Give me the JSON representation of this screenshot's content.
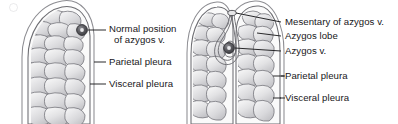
{
  "figure": {
    "background_color": "#ffffff",
    "ink_color": "#3a3a3e",
    "tissue_fill_light": "#f2f2f3",
    "tissue_fill_mid": "#d9d9dc",
    "tissue_fill_dark": "#b9b9bd",
    "vein_color": "#4a4a4e",
    "text_color": "#17171a"
  },
  "panels": [
    {
      "id": "normal-lung",
      "name": "Normal lung apex with normal azygos vein position",
      "labels": [
        {
          "id": "normal-position-azygos",
          "text": "Normal position of azygos v.",
          "line1": "Normal position",
          "line2": "of azygos v."
        },
        {
          "id": "parietal-pleura-left",
          "text": "Parietal pleura"
        },
        {
          "id": "visceral-pleura-left",
          "text": "Visceral pleura"
        }
      ],
      "structures": [
        "lung-apex-outline",
        "parietal-pleura-line",
        "visceral-pleura-line",
        "azygos-vein-marker",
        "lung-lobule-texture"
      ]
    },
    {
      "id": "azygos-lobe-lung",
      "name": "Lung apex with azygos lobe variant",
      "labels": [
        {
          "id": "mesentary-of-azygos",
          "text": "Mesentary of azygos v."
        },
        {
          "id": "azygos-lobe",
          "text": "Azygos lobe"
        },
        {
          "id": "azygos-vein",
          "text": "Azygos v."
        },
        {
          "id": "parietal-pleura-right",
          "text": "Parietal pleura"
        },
        {
          "id": "visceral-pleura-right",
          "text": "Visceral pleura"
        }
      ],
      "structures": [
        "lung-apex-outline",
        "azygos-lobe-fissure",
        "azygos-mesentery-fold",
        "azygos-vein-marker",
        "parietal-pleura-line",
        "visceral-pleura-line",
        "lung-lobule-texture"
      ]
    }
  ]
}
